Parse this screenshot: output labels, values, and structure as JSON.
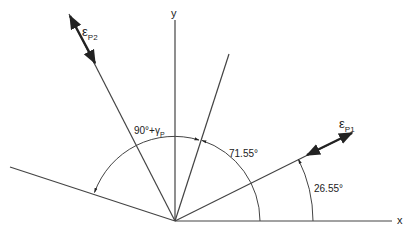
{
  "diagram": {
    "axes": {
      "x_label": "x",
      "y_label": "y"
    },
    "labels": {
      "eps_p1_main": "ε",
      "eps_p1_sub": "P1",
      "eps_p2_main": "ε",
      "eps_p2_sub": "P2",
      "angle_90_gamma": "90°+γ",
      "angle_90_gamma_sub": "P",
      "angle_71": "71.55°",
      "angle_26": "26.55°"
    },
    "angles_deg": {
      "eps_p1_direction": 26.55,
      "inner_line": 71.55,
      "eps_p2_direction": 116.55
    },
    "colors": {
      "line": "#333333",
      "background": "#ffffff"
    }
  }
}
